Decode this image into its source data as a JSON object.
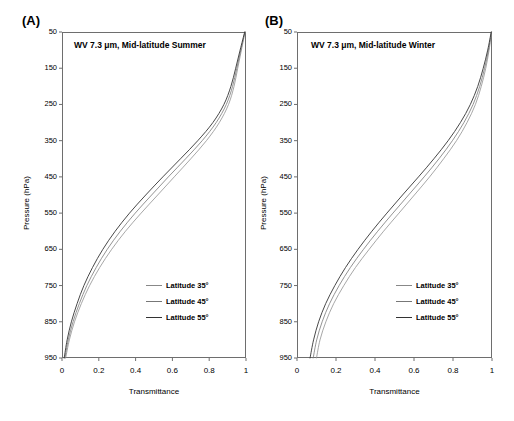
{
  "figure": {
    "xlabel": "Transmittance",
    "ylabel": "Pressure (hPa)"
  },
  "panels": [
    {
      "label": "(A)",
      "title": "WV 7.3  μm, Mid-latitude Summer"
    },
    {
      "label": "(B)",
      "title": "WV 7.3  μm, Mid-latitude Winter"
    }
  ],
  "axes": {
    "yticks": [
      "50",
      "150",
      "250",
      "350",
      "450",
      "550",
      "650",
      "750",
      "850",
      "950"
    ],
    "xticks": [
      "0",
      "0.2",
      "0.4",
      "0.6",
      "0.8",
      "1"
    ]
  },
  "legend": [
    {
      "label": "Latitude 35°",
      "color": "#909090"
    },
    {
      "label": "Latitude 45°",
      "color": "#777777"
    },
    {
      "label": "Latitude 55°",
      "color": "#333333"
    }
  ],
  "chart_data": [
    {
      "type": "line",
      "title": "WV 7.3 μm, Mid-latitude Summer",
      "xlabel": "Transmittance",
      "ylabel": "Pressure (hPa)",
      "xlim": [
        0,
        1
      ],
      "ylim": [
        950,
        50
      ],
      "y_inverted": true,
      "grid": false,
      "legend_position": "lower-right",
      "pressure": [
        50,
        100,
        150,
        200,
        250,
        300,
        350,
        400,
        450,
        500,
        550,
        600,
        650,
        700,
        750,
        800,
        850,
        900,
        950
      ],
      "series": [
        {
          "name": "Latitude 35°",
          "color": "#909090",
          "values": [
            0.995,
            0.975,
            0.955,
            0.935,
            0.905,
            0.855,
            0.785,
            0.7,
            0.61,
            0.52,
            0.43,
            0.345,
            0.27,
            0.205,
            0.15,
            0.105,
            0.068,
            0.04,
            0.02
          ]
        },
        {
          "name": "Latitude 45°",
          "color": "#777777",
          "values": [
            0.994,
            0.972,
            0.95,
            0.927,
            0.893,
            0.838,
            0.762,
            0.672,
            0.578,
            0.487,
            0.398,
            0.317,
            0.246,
            0.186,
            0.135,
            0.094,
            0.06,
            0.034,
            0.016
          ]
        },
        {
          "name": "Latitude 55°",
          "color": "#333333",
          "values": [
            0.993,
            0.968,
            0.944,
            0.918,
            0.88,
            0.82,
            0.738,
            0.644,
            0.548,
            0.455,
            0.367,
            0.289,
            0.222,
            0.166,
            0.119,
            0.082,
            0.051,
            0.028,
            0.012
          ]
        }
      ]
    },
    {
      "type": "line",
      "title": "WV 7.3 μm, Mid-latitude Winter",
      "xlabel": "Transmittance",
      "ylabel": "Pressure (hPa)",
      "xlim": [
        0,
        1
      ],
      "ylim": [
        950,
        50
      ],
      "y_inverted": true,
      "grid": false,
      "legend_position": "lower-right",
      "pressure": [
        50,
        100,
        150,
        200,
        250,
        300,
        350,
        400,
        450,
        500,
        550,
        600,
        650,
        700,
        750,
        800,
        850,
        900,
        950
      ],
      "series": [
        {
          "name": "Latitude 35°",
          "color": "#909090",
          "values": [
            0.998,
            0.985,
            0.968,
            0.945,
            0.915,
            0.872,
            0.818,
            0.752,
            0.68,
            0.602,
            0.523,
            0.444,
            0.37,
            0.3,
            0.24,
            0.188,
            0.148,
            0.118,
            0.1
          ]
        },
        {
          "name": "Latitude 45°",
          "color": "#777777",
          "values": [
            0.997,
            0.982,
            0.962,
            0.937,
            0.903,
            0.856,
            0.797,
            0.728,
            0.652,
            0.572,
            0.492,
            0.414,
            0.341,
            0.274,
            0.216,
            0.167,
            0.129,
            0.101,
            0.083
          ]
        },
        {
          "name": "Latitude 55°",
          "color": "#333333",
          "values": [
            0.996,
            0.978,
            0.955,
            0.927,
            0.889,
            0.838,
            0.775,
            0.702,
            0.623,
            0.541,
            0.461,
            0.384,
            0.313,
            0.249,
            0.194,
            0.147,
            0.111,
            0.085,
            0.067
          ]
        }
      ]
    }
  ]
}
